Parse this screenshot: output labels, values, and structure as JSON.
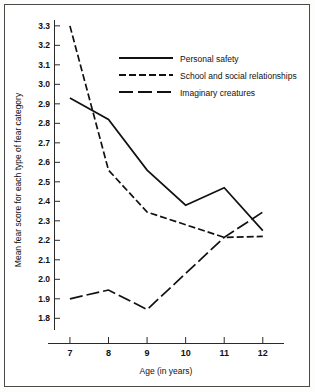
{
  "chart_data": {
    "type": "line",
    "title": "",
    "xlabel": "Age (in years)",
    "ylabel": "Mean fear score for each type of fear category",
    "x": [
      7,
      8,
      9,
      10,
      11,
      12
    ],
    "categories": [
      "7",
      "8",
      "9",
      "10",
      "11",
      "12"
    ],
    "xlim": [
      6.6,
      12.55
    ],
    "ylim": [
      1.74,
      3.33
    ],
    "ytick_labels": [
      "1.8",
      "1.9",
      "2.0",
      "2.1",
      "2.2",
      "2.3",
      "2.4",
      "2.5",
      "2.6",
      "2.7",
      "2.8",
      "2.9",
      "3.0",
      "3.1",
      "3.2",
      "3.3"
    ],
    "ytick_values": [
      1.8,
      1.9,
      2.0,
      2.1,
      2.2,
      2.3,
      2.4,
      2.5,
      2.6,
      2.7,
      2.8,
      2.9,
      3.0,
      3.1,
      3.2,
      3.3
    ],
    "grid": false,
    "legend_position": "upper-center",
    "series": [
      {
        "name": "Personal safety",
        "style": "solid",
        "dasharray": "",
        "values": [
          2.93,
          2.82,
          2.56,
          2.38,
          2.47,
          2.25
        ]
      },
      {
        "name": "School and social relationships",
        "style": "short-dash",
        "dasharray": "7,3",
        "values": [
          3.3,
          2.56,
          2.345,
          2.28,
          2.215,
          2.22
        ]
      },
      {
        "name": "Imaginary creatures",
        "style": "long-dash",
        "dasharray": "13,4",
        "values": [
          1.9,
          1.945,
          1.845,
          2.03,
          2.215,
          2.345
        ]
      }
    ]
  },
  "legend": {
    "entries": [
      {
        "label": "Personal safety",
        "dasharray": ""
      },
      {
        "label": "School and social relationships",
        "dasharray": "7,3"
      },
      {
        "label": "Imaginary creatures",
        "dasharray": "14,5"
      }
    ]
  },
  "axes": {
    "x_title": "Age (in years)",
    "y_title": "Mean fear score for each type of fear category"
  },
  "colors": {
    "ink": "#111111",
    "axis": "#2a2a2a",
    "frame": "#4a4a4a",
    "background": "#ffffff"
  }
}
